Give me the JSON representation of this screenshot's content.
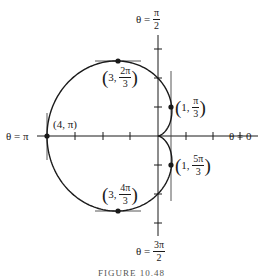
{
  "diagram": {
    "type": "polar_curve",
    "equation": "r = 2 - 2cosθ",
    "axes": {
      "right_label": "θ = 0",
      "left_label": "θ = π",
      "top_label": {
        "prefix": "θ = ",
        "num": "π",
        "den": "2"
      },
      "bottom_label": {
        "prefix": "θ = ",
        "num": "3π",
        "den": "2"
      }
    },
    "points": [
      {
        "id": "p1",
        "r": "1",
        "theta_num": "π",
        "theta_den": "3",
        "tangent": "vertical"
      },
      {
        "id": "p2",
        "r": "3",
        "theta_num": "2π",
        "theta_den": "3",
        "tangent": "horizontal"
      },
      {
        "id": "p3",
        "r": "4",
        "theta": "π",
        "label": "(4, π)",
        "tangent": "vertical"
      },
      {
        "id": "p4",
        "r": "3",
        "theta_num": "4π",
        "theta_den": "3",
        "tangent": "horizontal"
      },
      {
        "id": "p5",
        "r": "1",
        "theta_num": "5π",
        "theta_den": "3",
        "tangent": "vertical"
      }
    ],
    "caption": "FIGURE 10.48",
    "colors": {
      "stroke": "#1a1a1a",
      "tangent": "#444444",
      "background": "#ffffff"
    }
  }
}
